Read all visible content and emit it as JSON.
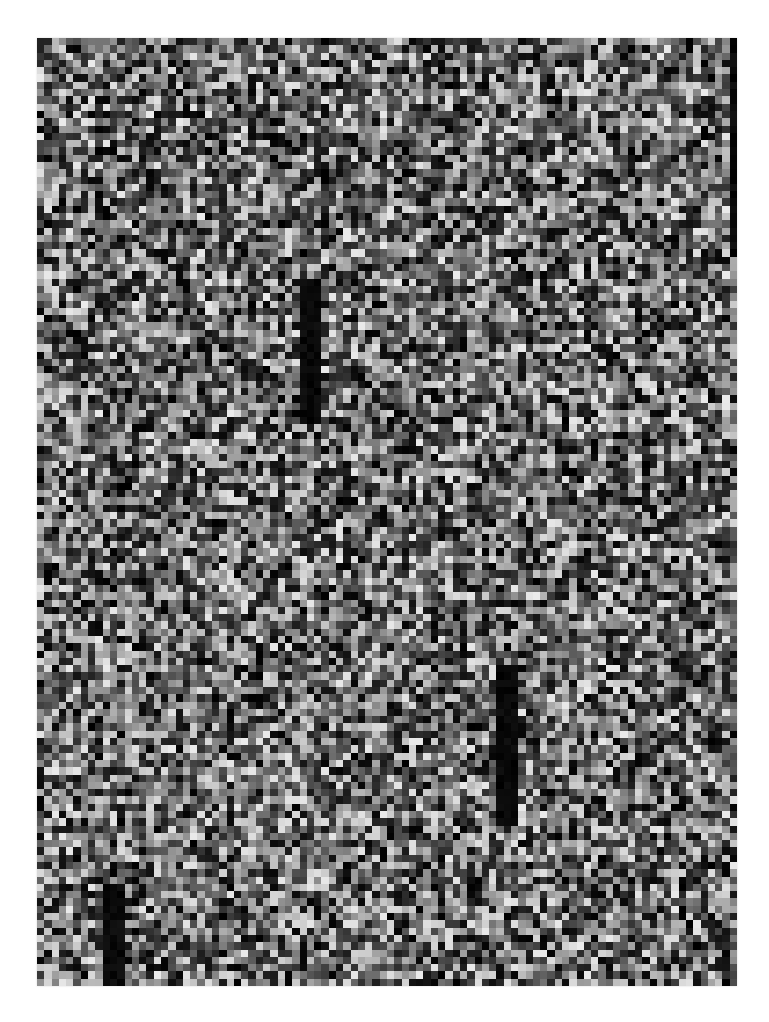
{
  "image": {
    "description": "Grayscale random noise pattern with dark vertical streaks",
    "background": "#ffffff",
    "frame": {
      "x": 37,
      "y": 38,
      "width": 700,
      "height": 948
    },
    "grid": {
      "columns": 96,
      "rows": 130
    },
    "palette": {
      "min_gray": 0,
      "max_gray": 235
    },
    "seed": 1337,
    "streaks": [
      {
        "col": 96.5,
        "row_start": 0,
        "row_end": 30,
        "width_cols": 2
      },
      {
        "col": 37.5,
        "row_start": 33,
        "row_end": 53,
        "width_cols": 2
      },
      {
        "col": 64.5,
        "row_start": 86,
        "row_end": 108,
        "width_cols": 2
      },
      {
        "col": 10.5,
        "row_start": 116,
        "row_end": 130,
        "width_cols": 2
      }
    ]
  }
}
